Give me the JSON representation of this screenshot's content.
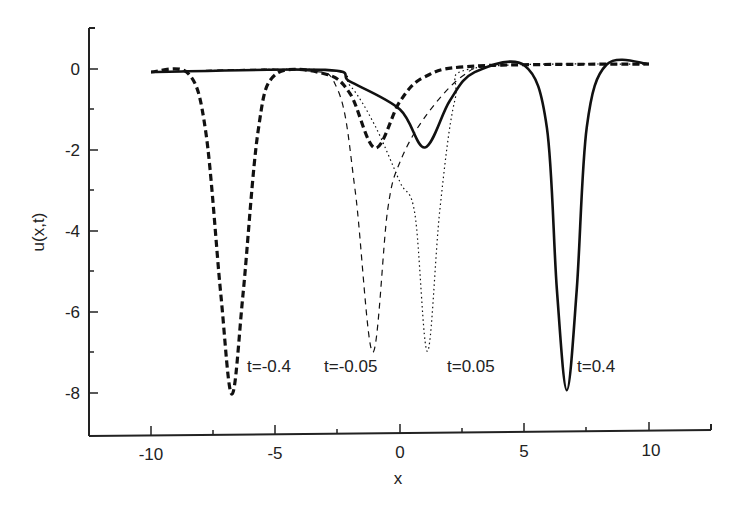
{
  "chart_data": {
    "type": "line",
    "title": "",
    "xlabel": "x",
    "ylabel": "u(x,t)",
    "xlim": [
      -12.5,
      12.5
    ],
    "ylim": [
      -9,
      1
    ],
    "xticks": [
      -10,
      -5,
      0,
      5,
      10
    ],
    "yticks": [
      0,
      -2,
      -4,
      -6,
      -8
    ],
    "grid": false,
    "legend": "none (inline annotations)",
    "series": [
      {
        "name": "t=-0.4",
        "style": "thick-dashed",
        "points": [
          [
            -10,
            0
          ],
          [
            -8.5,
            -0.05
          ],
          [
            -7.8,
            -1.5
          ],
          [
            -7.2,
            -5.5
          ],
          [
            -6.75,
            -8
          ],
          [
            -6.3,
            -5.5
          ],
          [
            -5.7,
            -1.5
          ],
          [
            -5,
            -0.1
          ],
          [
            -3,
            -0.1
          ],
          [
            -2,
            -0.6
          ],
          [
            -1,
            -1.95
          ],
          [
            0,
            -0.8
          ],
          [
            1,
            -0.2
          ],
          [
            3,
            0.05
          ],
          [
            10,
            0.05
          ]
        ]
      },
      {
        "name": "t=-0.05",
        "style": "thin-dashed",
        "points": [
          [
            -10,
            0
          ],
          [
            -4,
            0
          ],
          [
            -2.5,
            -0.5
          ],
          [
            -1.8,
            -3
          ],
          [
            -1.1,
            -7
          ],
          [
            -0.5,
            -3.5
          ],
          [
            0,
            -2.3
          ],
          [
            1,
            -1.2
          ],
          [
            2.5,
            -0.2
          ],
          [
            4,
            0.05
          ],
          [
            10,
            0.05
          ]
        ]
      },
      {
        "name": "t=0.05",
        "style": "dotted",
        "points": [
          [
            -10,
            0
          ],
          [
            -3,
            0
          ],
          [
            -2,
            -0.4
          ],
          [
            -1,
            -1.4
          ],
          [
            0,
            -2.8
          ],
          [
            0.6,
            -3.6
          ],
          [
            1.1,
            -7
          ],
          [
            1.6,
            -3.5
          ],
          [
            2.2,
            -0.8
          ],
          [
            3,
            0.0
          ],
          [
            10,
            0.05
          ]
        ]
      },
      {
        "name": "t=0.4",
        "style": "solid",
        "points": [
          [
            -10,
            0
          ],
          [
            -3,
            0
          ],
          [
            -2,
            -0.3
          ],
          [
            0,
            -1.0
          ],
          [
            1,
            -1.95
          ],
          [
            2,
            -0.8
          ],
          [
            3,
            -0.1
          ],
          [
            5,
            0.05
          ],
          [
            5.9,
            -1.5
          ],
          [
            6.3,
            -5.5
          ],
          [
            6.7,
            -8
          ],
          [
            7.1,
            -5.5
          ],
          [
            7.5,
            -1.5
          ],
          [
            8.3,
            0.05
          ],
          [
            10,
            0.05
          ]
        ]
      }
    ],
    "annotations": [
      {
        "text": "t=-0.4",
        "x": -6.3,
        "y": -7.3
      },
      {
        "text": "t=-0.05",
        "x": -3.1,
        "y": -7.3
      },
      {
        "text": "t=0.05",
        "x": 1.5,
        "y": -7.3
      },
      {
        "text": "t=0.4",
        "x": 7.0,
        "y": -7.3
      }
    ]
  },
  "labels": {
    "xlabel": "x",
    "ylabel": "u(x,t)",
    "xticks": [
      "-10",
      "-5",
      "0",
      "5",
      "10"
    ],
    "yticks": [
      "0",
      "-2",
      "-4",
      "-6",
      "-8"
    ],
    "ann0": "t=-0.4",
    "ann1": "t=-0.05",
    "ann2": "t=0.05",
    "ann3": "t=0.4"
  }
}
